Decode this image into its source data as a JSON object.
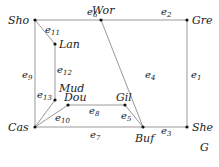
{
  "graph": {
    "name": "G",
    "nodes": [
      {
        "id": "Sho",
        "label": "Sho",
        "x": 35,
        "y": 20,
        "lx": 8,
        "ly": 24
      },
      {
        "id": "Wor",
        "label": "Wor",
        "x": 101,
        "y": 20,
        "lx": 92,
        "ly": 14
      },
      {
        "id": "Gre",
        "label": "Gre",
        "x": 187,
        "y": 20,
        "lx": 192,
        "ly": 24
      },
      {
        "id": "Lan",
        "label": "Lan",
        "x": 55,
        "y": 44,
        "lx": 59,
        "ly": 48
      },
      {
        "id": "Mud",
        "label": "Mud",
        "x": 55,
        "y": 100,
        "lx": 59,
        "ly": 92
      },
      {
        "id": "Dou",
        "label": "Dou",
        "x": 68,
        "y": 105,
        "lx": 64,
        "ly": 101
      },
      {
        "id": "Gil",
        "label": "Gil",
        "x": 125,
        "y": 105,
        "lx": 116,
        "ly": 101
      },
      {
        "id": "Cas",
        "label": "Cas",
        "x": 35,
        "y": 127,
        "lx": 8,
        "ly": 131
      },
      {
        "id": "Buf",
        "label": "Buf",
        "x": 143,
        "y": 127,
        "lx": 135,
        "ly": 142
      },
      {
        "id": "She",
        "label": "She",
        "x": 187,
        "y": 127,
        "lx": 192,
        "ly": 131
      }
    ],
    "edges": [
      {
        "id": "e1",
        "base": "e",
        "sub": "1",
        "from": "Gre",
        "to": "She",
        "lx": 191,
        "ly": 78
      },
      {
        "id": "e2",
        "base": "e",
        "sub": "2",
        "from": "Wor",
        "to": "Gre",
        "lx": 161,
        "ly": 15
      },
      {
        "id": "e3",
        "base": "e",
        "sub": "3",
        "from": "Buf",
        "to": "She",
        "lx": 161,
        "ly": 134
      },
      {
        "id": "e4",
        "base": "e",
        "sub": "4",
        "from": "Wor",
        "to": "Buf",
        "lx": 145,
        "ly": 78
      },
      {
        "id": "e5",
        "base": "e",
        "sub": "5",
        "from": "Gil",
        "to": "Buf",
        "lx": 121,
        "ly": 119
      },
      {
        "id": "e6",
        "base": "e",
        "sub": "6",
        "from": "Sho",
        "to": "Wor",
        "lx": 87,
        "ly": 15
      },
      {
        "id": "e7",
        "base": "e",
        "sub": "7",
        "from": "Cas",
        "to": "Buf",
        "lx": 90,
        "ly": 138
      },
      {
        "id": "e8",
        "base": "e",
        "sub": "8",
        "from": "Dou",
        "to": "Gil",
        "lx": 89,
        "ly": 114
      },
      {
        "id": "e9",
        "base": "e",
        "sub": "9",
        "from": "Sho",
        "to": "Cas",
        "lx": 22,
        "ly": 78
      },
      {
        "id": "e10",
        "base": "e",
        "sub": "10",
        "from": "Cas",
        "to": "Dou",
        "lx": 55,
        "ly": 121
      },
      {
        "id": "e11",
        "base": "e",
        "sub": "11",
        "from": "Sho",
        "to": "Lan",
        "lx": 45,
        "ly": 33
      },
      {
        "id": "e12",
        "base": "e",
        "sub": "12",
        "from": "Lan",
        "to": "Mud",
        "lx": 57,
        "ly": 73
      },
      {
        "id": "e13",
        "base": "e",
        "sub": "13",
        "from": "Cas",
        "to": "Mud",
        "lx": 37,
        "ly": 98
      }
    ],
    "title_label": {
      "text": "G",
      "x": 83,
      "y": 151
    }
  }
}
